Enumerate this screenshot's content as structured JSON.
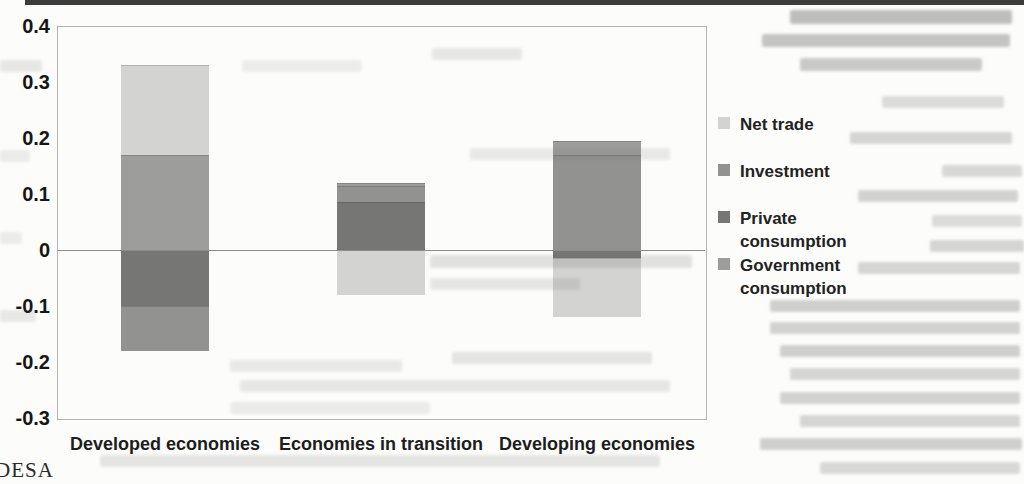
{
  "page": {
    "source_note_partial": "DESA"
  },
  "chart_data": {
    "type": "bar",
    "stacked": true,
    "title": "",
    "xlabel": "",
    "ylabel": "",
    "categories": [
      "Developed economies",
      "Economies in transition",
      "Developing economies"
    ],
    "series": [
      {
        "name": "Private consumption",
        "color": "#767674",
        "values": [
          -0.1,
          0.085,
          -0.015
        ]
      },
      {
        "name": "Investment",
        "color": "#929290",
        "values": [
          -0.08,
          0.03,
          0.17
        ]
      },
      {
        "name": "Government consumption",
        "color": "#9d9d9b",
        "values": [
          0.17,
          0.005,
          0.025
        ]
      },
      {
        "name": "Net trade",
        "color": "#d3d3d1",
        "values": [
          0.16,
          -0.08,
          -0.105
        ]
      }
    ],
    "legend": [
      {
        "label": "Net trade",
        "series": "Net trade"
      },
      {
        "label": "Investment",
        "series": "Investment"
      },
      {
        "label": "Private consumption",
        "series": "Private consumption"
      },
      {
        "label": "Government consumption",
        "series": "Government consumption"
      }
    ],
    "y_axis": {
      "min": -0.3,
      "max": 0.4,
      "step": 0.1,
      "tick_labels": [
        "0.4",
        "0.3",
        "0.2",
        "0.1",
        "0",
        "-0.1",
        "-0.2",
        "-0.3"
      ]
    },
    "grid": "zero-line-only",
    "legend_position": "right"
  }
}
